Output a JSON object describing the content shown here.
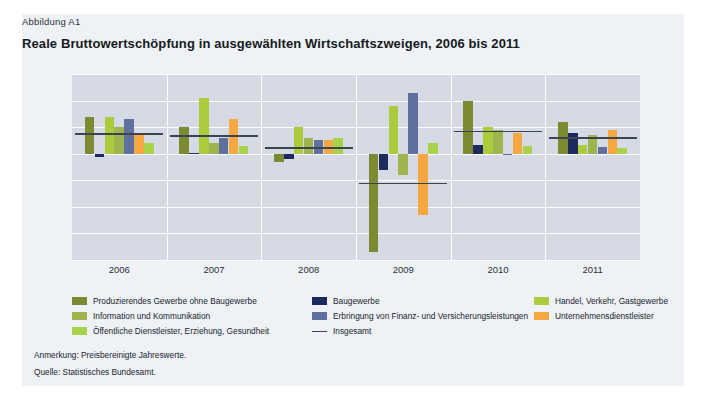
{
  "figure": {
    "label": "Abbildung A1",
    "title": "Reale Bruttowertschöpfung in ausgewählten Wirtschaftszweigen, 2006 bis 2011",
    "note": "Anmerkung: Preisbereinigte Jahreswerte.",
    "source": "Quelle: Statistisches Bundesamt."
  },
  "colors": {
    "card_bg": "#eef2f7",
    "plot_bg": "#d5dae4",
    "grid": "#ffffff",
    "total_line": "#3c4454",
    "dark_olive": "#7c8b31",
    "navy": "#1d2a5e",
    "sage": "#9db44f",
    "yellow_green": "#aacb3c",
    "blue_gray": "#5f6f9e",
    "orange": "#f5a742",
    "light_green": "#a8d24a"
  },
  "legend": {
    "items": [
      {
        "label": "Produzierendes Gewerbe ohne Baugewerbe",
        "color": "#7c8b31",
        "kind": "swatch"
      },
      {
        "label": "Baugewerbe",
        "color": "#1d2a5e",
        "kind": "swatch"
      },
      {
        "label": "Handel, Verkehr, Gastgewerbe",
        "color": "#aacb3c",
        "kind": "swatch"
      },
      {
        "label": "Information und Kommunikation",
        "color": "#9db44f",
        "kind": "swatch"
      },
      {
        "label": "Erbringung von Finanz- und Versicherungsleistungen",
        "color": "#5f6f9e",
        "kind": "swatch"
      },
      {
        "label": "Unternehmensdienstleister",
        "color": "#f5a742",
        "kind": "swatch"
      },
      {
        "label": "Öffentliche Dienstleister, Erziehung, Gesundheit",
        "color": "#a8d24a",
        "kind": "swatch"
      },
      {
        "label": "Insgesamt",
        "color": "#3c4454",
        "kind": "line"
      }
    ]
  },
  "chart_data": {
    "type": "bar",
    "title": "Reale Bruttowertschöpfung in ausgewählten Wirtschaftszweigen, 2006 bis 2011",
    "xlabel": "",
    "ylabel": "Veränderung gegenüber Vorjahr in Prozent",
    "ylim": [
      -20,
      15
    ],
    "yticks": [
      15,
      10,
      5,
      0,
      -5,
      -10,
      -15,
      -20
    ],
    "grid": true,
    "legend_position": "bottom",
    "categories": [
      "2006",
      "2007",
      "2008",
      "2009",
      "2010",
      "2011"
    ],
    "series": [
      {
        "name": "Produzierendes Gewerbe ohne Baugewerbe",
        "color": "#7c8b31",
        "values": [
          7.0,
          5.0,
          -1.5,
          -18.5,
          10.0,
          6.0
        ]
      },
      {
        "name": "Baugewerbe",
        "color": "#1d2a5e",
        "values": [
          -0.6,
          0.2,
          -1.0,
          -3.0,
          1.7,
          4.0
        ]
      },
      {
        "name": "Handel, Verkehr, Gastgewerbe",
        "color": "#aacb3c",
        "values": [
          7.0,
          10.5,
          5.0,
          9.0,
          5.0,
          1.7
        ]
      },
      {
        "name": "Information und Kommunikation",
        "color": "#9db44f",
        "values": [
          5.0,
          2.0,
          3.0,
          -4.0,
          4.5,
          3.5
        ]
      },
      {
        "name": "Erbringung von Finanz- und Versicherungsleistungen",
        "color": "#5f6f9e",
        "values": [
          6.5,
          3.0,
          2.5,
          11.5,
          -0.2,
          1.2
        ]
      },
      {
        "name": "Unternehmensdienstleister",
        "color": "#f5a742",
        "values": [
          3.5,
          6.5,
          2.5,
          -11.5,
          4.0,
          4.5
        ]
      },
      {
        "name": "Öffentliche Dienstleister, Erziehung, Gesundheit",
        "color": "#a8d24a",
        "values": [
          2.0,
          1.5,
          3.0,
          2.0,
          1.5,
          1.0
        ]
      }
    ],
    "total_line": {
      "name": "Insgesamt",
      "color": "#3c4454",
      "values": [
        3.7,
        3.3,
        1.1,
        -5.6,
        4.2,
        3.0
      ]
    }
  }
}
